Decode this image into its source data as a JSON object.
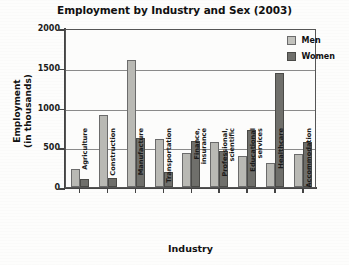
{
  "chart_data": {
    "type": "bar",
    "title": "Employment by Industry and Sex (2003)",
    "xlabel": "Industry",
    "ylabel": "Employment\n(in thousands)",
    "ylabel_line1": "Employment",
    "ylabel_line2": "(in thousands)",
    "ylim": [
      0,
      2000
    ],
    "yticks": [
      0,
      500,
      1000,
      1500,
      2000
    ],
    "ytick_labels": [
      "0",
      "500",
      "1000",
      "1500",
      "2000"
    ],
    "grid": true,
    "legend_position": "top-right",
    "categories": [
      "Agriculture",
      "Construction",
      "Manufacture",
      "Transportation",
      "Finance,\ninsurance",
      "Professional,\nscientific",
      "Educational\nservices",
      "Healthcare",
      "Accommodation"
    ],
    "series": [
      {
        "name": "Men",
        "color": "#b9b9b4",
        "values": [
          230,
          900,
          1600,
          600,
          430,
          560,
          390,
          300,
          410
        ]
      },
      {
        "name": "Women",
        "color": "#6f6f6b",
        "values": [
          100,
          110,
          620,
          190,
          580,
          450,
          720,
          1440,
          570
        ]
      }
    ]
  },
  "legend": {
    "items": [
      {
        "label": "Men",
        "swatch": "men"
      },
      {
        "label": "Women",
        "swatch": "women"
      }
    ]
  }
}
